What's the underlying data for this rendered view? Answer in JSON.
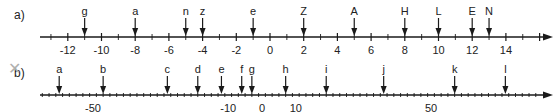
{
  "lines": [
    {
      "id": "a",
      "part_label": "a)",
      "axis_y": 37,
      "x_start": 40,
      "x_end": 553,
      "origin_x": 270,
      "px_per_unit": 16.85,
      "min_tick": -13,
      "max_tick": 16,
      "minor_step": 1,
      "major_step": 2,
      "tick_labels": [
        "-12",
        "-10",
        "-8",
        "-6",
        "-4",
        "-2",
        "0",
        "2",
        "4",
        "6",
        "8",
        "10",
        "12",
        "14"
      ],
      "tick_label_values": [
        -12,
        -10,
        -8,
        -6,
        -4,
        -2,
        0,
        2,
        4,
        6,
        8,
        10,
        12,
        14
      ],
      "points": [
        {
          "label": "g",
          "value": -11
        },
        {
          "label": "a",
          "value": -8
        },
        {
          "label": "n",
          "value": -5
        },
        {
          "label": "z",
          "value": -4
        },
        {
          "label": "e",
          "value": -1
        },
        {
          "label": "Z",
          "value": 2
        },
        {
          "label": "A",
          "value": 5
        },
        {
          "label": "H",
          "value": 8
        },
        {
          "label": "L",
          "value": 10
        },
        {
          "label": "E",
          "value": 12
        },
        {
          "label": "N",
          "value": 13
        }
      ]
    },
    {
      "id": "b",
      "part_label": "b)",
      "axis_y": 95,
      "x_start": 40,
      "x_end": 553,
      "origin_x": 262,
      "px_per_unit": 3.38,
      "min_tick": -65,
      "max_tick": 85,
      "minor_step": 2,
      "major_step": 10,
      "tick_labels": [
        "-50",
        "-10",
        "0",
        "10",
        "50"
      ],
      "tick_label_values": [
        -50,
        -10,
        0,
        10,
        50
      ],
      "points": [
        {
          "label": "a",
          "value": -60
        },
        {
          "label": "b",
          "value": -47
        },
        {
          "label": "c",
          "value": -28
        },
        {
          "label": "d",
          "value": -19
        },
        {
          "label": "e",
          "value": -12
        },
        {
          "label": "f",
          "value": -6
        },
        {
          "label": "g",
          "value": -3
        },
        {
          "label": "h",
          "value": 7
        },
        {
          "label": "i",
          "value": 19
        },
        {
          "label": "j",
          "value": 36
        },
        {
          "label": "k",
          "value": 57
        },
        {
          "label": "l",
          "value": 72
        }
      ]
    }
  ],
  "mark": {
    "symbol": "✕",
    "color": "#b0b0b0"
  },
  "colors": {
    "ink": "#1a1a1a",
    "text": "#222222"
  }
}
